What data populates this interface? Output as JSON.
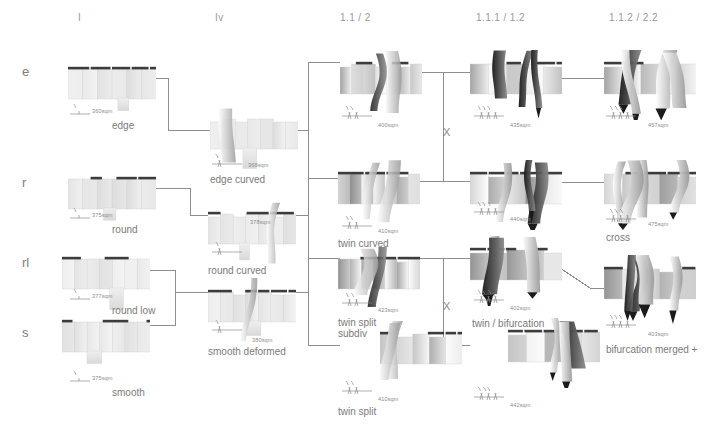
{
  "sheet": {
    "title": "morphology matrix",
    "bg": "#ffffff",
    "ink": "#8e8e8e",
    "text": "#7a7a7a"
  },
  "columns": [
    {
      "label": "I",
      "x": 78
    },
    {
      "label": "Iv",
      "x": 215
    },
    {
      "label": "1.1 / 2",
      "x": 340
    },
    {
      "label": "1.1.1 / 1.2",
      "x": 476
    },
    {
      "label": "1.1.2 / 2.2",
      "x": 609
    }
  ],
  "rows": [
    {
      "label": "e",
      "y": 64
    },
    {
      "label": "r",
      "y": 175
    },
    {
      "label": "rl",
      "y": 255
    },
    {
      "label": "s",
      "y": 325
    }
  ],
  "variants": [
    {
      "id": "edge",
      "name": "edge",
      "area": "360sqm",
      "col": 0,
      "row": 0,
      "nx": 68,
      "ny": 55,
      "ax": 92,
      "ay": 108,
      "lx": 112,
      "ly": 120,
      "gx": 70,
      "gy": 102
    },
    {
      "id": "round",
      "name": "round",
      "area": "375sqm",
      "col": 0,
      "row": 1,
      "nx": 68,
      "ny": 165,
      "ax": 92,
      "ay": 212,
      "lx": 112,
      "ly": 224,
      "gx": 70,
      "gy": 206
    },
    {
      "id": "round-low",
      "name": "round low",
      "area": "377sqm",
      "col": 0,
      "row": 2,
      "nx": 62,
      "ny": 245,
      "ax": 92,
      "ay": 293,
      "lx": 112,
      "ly": 305,
      "gx": 70,
      "gy": 287
    },
    {
      "id": "smooth",
      "name": "smooth",
      "area": "375sqm",
      "col": 0,
      "row": 3,
      "nx": 62,
      "ny": 308,
      "ax": 92,
      "ay": 375,
      "lx": 112,
      "ly": 387,
      "gx": 70,
      "gy": 369
    },
    {
      "id": "edge-curved",
      "name": "edge curved",
      "area": "368sqm",
      "col": 1,
      "row": 0,
      "nx": 210,
      "ny": 105,
      "ax": 248,
      "ay": 162,
      "lx": 210,
      "ly": 174,
      "gx": 212,
      "gy": 152
    },
    {
      "id": "round-curved",
      "name": "round curved",
      "area": "378sqm",
      "col": 1,
      "row": 1,
      "nx": 208,
      "ny": 200,
      "ax": 250,
      "ay": 219,
      "lx": 208,
      "ly": 265,
      "gx": 212,
      "gy": 240
    },
    {
      "id": "smooth-deformed",
      "name": "smooth deformed",
      "area": "380sqm",
      "col": 1,
      "row": 2,
      "nx": 208,
      "ny": 278,
      "ax": 252,
      "ay": 337,
      "lx": 208,
      "ly": 346,
      "gx": 212,
      "gy": 318
    },
    {
      "id": "twin",
      "name": "",
      "area": "400sqm",
      "col": 2,
      "row": 0,
      "nx": 340,
      "ny": 50,
      "ax": 378,
      "ay": 122,
      "lx": 340,
      "ly": 133,
      "gx": 342,
      "gy": 104
    },
    {
      "id": "twin-curved",
      "name": "twin curved",
      "area": "410sqm",
      "col": 2,
      "row": 1,
      "nx": 338,
      "ny": 160,
      "ax": 378,
      "ay": 228,
      "lx": 338,
      "ly": 238,
      "gx": 342,
      "gy": 214
    },
    {
      "id": "twin-split-subdiv",
      "name": "twin split\nsubdiv",
      "area": "423sqm",
      "col": 2,
      "row": 2,
      "nx": 338,
      "ny": 245,
      "ax": 378,
      "ay": 307,
      "lx": 338,
      "ly": 317,
      "gx": 342,
      "gy": 291
    },
    {
      "id": "twin-split",
      "name": "twin split",
      "area": "410sqm",
      "col": 2,
      "row": 3,
      "nx": 380,
      "ny": 320,
      "ax": 378,
      "ay": 396,
      "lx": 338,
      "ly": 406,
      "gx": 342,
      "gy": 379
    },
    {
      "id": "twin-a",
      "name": "",
      "area": "435sqm",
      "col": 3,
      "row": 0,
      "nx": 470,
      "ny": 50,
      "ax": 510,
      "ay": 122,
      "lx": 472,
      "ly": 133,
      "gx": 474,
      "gy": 104
    },
    {
      "id": "twin-b",
      "name": "",
      "area": "440sqm",
      "col": 3,
      "row": 1,
      "nx": 470,
      "ny": 160,
      "ax": 510,
      "ay": 216,
      "lx": 472,
      "ly": 228,
      "gx": 474,
      "gy": 200
    },
    {
      "id": "twin-bifurcation",
      "name": "twin / bifurcation",
      "area": "402sqm",
      "col": 3,
      "row": 2,
      "nx": 470,
      "ny": 236,
      "ax": 510,
      "ay": 305,
      "lx": 472,
      "ly": 318,
      "gx": 474,
      "gy": 288
    },
    {
      "id": "bifurcation-fan",
      "name": "",
      "area": "442sqm",
      "col": 3,
      "row": 3,
      "nx": 508,
      "ny": 318,
      "ax": 510,
      "ay": 402,
      "lx": 472,
      "ly": 412,
      "gx": 474,
      "gy": 385
    },
    {
      "id": "cross-top",
      "name": "",
      "area": "457sqm",
      "col": 4,
      "row": 0,
      "nx": 604,
      "ny": 50,
      "ax": 648,
      "ay": 122,
      "lx": 606,
      "ly": 133,
      "gx": 606,
      "gy": 104
    },
    {
      "id": "cross",
      "name": "cross",
      "area": "475sqm",
      "col": 4,
      "row": 1,
      "nx": 604,
      "ny": 160,
      "ax": 648,
      "ay": 221,
      "lx": 606,
      "ly": 232,
      "gx": 606,
      "gy": 207
    },
    {
      "id": "bifurcation-merged",
      "name": "bifurcation merged +",
      "area": "403sqm",
      "col": 4,
      "row": 2,
      "nx": 604,
      "ny": 255,
      "ax": 648,
      "ay": 331,
      "lx": 606,
      "ly": 344,
      "gx": 606,
      "gy": 313
    }
  ],
  "operators": [
    {
      "label": "X",
      "x": 443,
      "y": 126
    },
    {
      "label": "X",
      "x": 443,
      "y": 300
    }
  ]
}
